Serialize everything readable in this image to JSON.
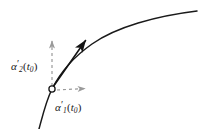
{
  "figure": {
    "type": "math-diagram",
    "width": 200,
    "height": 129,
    "background_color": "#ffffff"
  },
  "colors": {
    "curve": "#1a1a1a",
    "tangent_arrow": "#141414",
    "dashed_guide": "#9a9a9a",
    "label_text": "#1a1a1a",
    "point_marker_stroke": "#1a1a1a",
    "point_marker_fill": "#ffffff"
  },
  "labels": {
    "alpha2": {
      "symbol": "α",
      "prime": "′",
      "subscript": "2",
      "argument_open": "(",
      "argument_symbol": "t",
      "argument_subscript": "0",
      "argument_close": ")",
      "full_text": "α′2(t0)"
    },
    "alpha1": {
      "symbol": "α",
      "prime": "′",
      "subscript": "1",
      "argument_open": "(",
      "argument_symbol": "t",
      "argument_subscript": "0",
      "argument_close": ")",
      "full_text": "α′1(t0)"
    }
  },
  "geometry": {
    "point": {
      "x": 52,
      "y": 89,
      "radius": 3.1
    },
    "curve": {
      "start": {
        "x": 39,
        "y": 129
      },
      "through": {
        "x": 52,
        "y": 89
      },
      "end": {
        "x": 197,
        "y": 11
      },
      "stroke_width": 1.5
    },
    "tangent_vector": {
      "from": {
        "x": 53,
        "y": 87
      },
      "to": {
        "x": 88,
        "y": 37
      },
      "stroke_width": 1.6,
      "arrowhead": "filled-narrow"
    },
    "vertical_component": {
      "from": {
        "x": 52,
        "y": 86
      },
      "to": {
        "x": 52,
        "y": 37
      },
      "stroke_width": 1.2,
      "dash": "3 3",
      "arrowhead": "open-light"
    },
    "horizontal_component": {
      "from": {
        "x": 57,
        "y": 90
      },
      "to": {
        "x": 89,
        "y": 88
      },
      "stroke_width": 1.2,
      "dash": "3 3",
      "arrowhead": "open-light"
    }
  }
}
